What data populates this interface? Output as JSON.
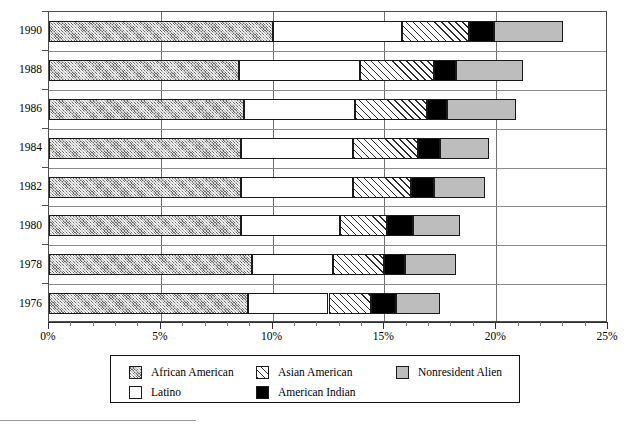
{
  "chart_data": {
    "type": "bar",
    "orientation": "horizontal",
    "stacked": true,
    "title": "",
    "xlabel": "",
    "ylabel": "",
    "xlim": [
      0,
      25
    ],
    "xunit": "%",
    "grid": true,
    "legend_position": "bottom",
    "categories": [
      "1976",
      "1978",
      "1980",
      "1982",
      "1984",
      "1986",
      "1988",
      "1990"
    ],
    "xticks": [
      "0%",
      "5%",
      "10%",
      "15%",
      "20%",
      "25%"
    ],
    "xtick_values": [
      0,
      5,
      10,
      15,
      20,
      25
    ],
    "xminor_step": 1,
    "series": [
      {
        "name": "African American",
        "fill": "african",
        "values": [
          8.9,
          9.1,
          8.6,
          8.6,
          8.6,
          8.7,
          8.5,
          10.0
        ]
      },
      {
        "name": "Latino",
        "fill": "latino",
        "values": [
          3.6,
          3.6,
          4.4,
          5.0,
          5.0,
          5.0,
          5.4,
          5.8
        ]
      },
      {
        "name": "Asian American",
        "fill": "asian",
        "values": [
          1.9,
          2.3,
          2.1,
          2.6,
          2.9,
          3.2,
          3.3,
          3.0
        ]
      },
      {
        "name": "American Indian",
        "fill": "amindian",
        "values": [
          1.1,
          0.9,
          1.2,
          1.0,
          1.0,
          0.9,
          1.0,
          1.1
        ]
      },
      {
        "name": "Nonresident Alien",
        "fill": "nonresident",
        "values": [
          2.0,
          2.3,
          2.1,
          2.3,
          2.2,
          3.1,
          3.0,
          3.1
        ]
      }
    ],
    "totals": [
      17.5,
      18.2,
      18.4,
      19.5,
      19.7,
      20.9,
      21.2,
      23.0
    ]
  },
  "legend": {
    "items": [
      {
        "label": "African American",
        "fill": "african"
      },
      {
        "label": "Asian American",
        "fill": "asian"
      },
      {
        "label": "Nonresident Alien",
        "fill": "nonresident"
      },
      {
        "label": "Latino",
        "fill": "latino"
      },
      {
        "label": "American Indian",
        "fill": "amindian"
      }
    ]
  },
  "colors": {
    "african": "#b9b9b9",
    "latino": "#ffffff",
    "asian": "#ffffff",
    "amindian": "#000000",
    "nonresident": "#bdbdbd",
    "axis": "#2e2e2e",
    "grid": "#6f6f6f"
  }
}
